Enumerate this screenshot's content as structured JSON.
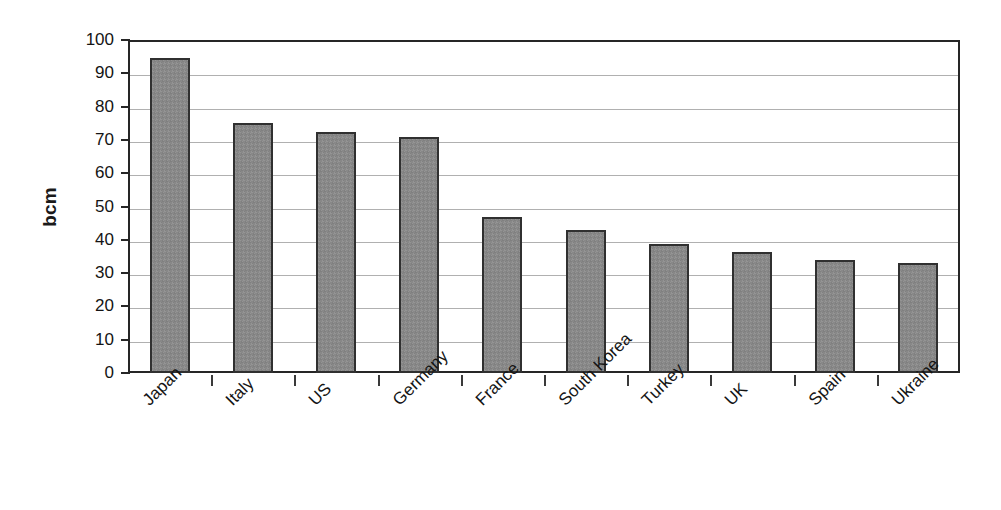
{
  "chart_data": {
    "type": "bar",
    "title": "",
    "xlabel": "",
    "ylabel": "bcm",
    "ylim": [
      0,
      100
    ],
    "ytick_step": 10,
    "yticks": [
      100,
      90,
      80,
      70,
      60,
      50,
      40,
      30,
      20,
      10,
      0
    ],
    "grid": true,
    "legend": false,
    "bar_color": "#888888",
    "bar_border_color": "#303030",
    "gridline_color": "#b0b0b0",
    "axis_color": "#262626",
    "categories": [
      "Japan",
      "Italy",
      "US",
      "Germany",
      "France",
      "South Korea",
      "Turkey",
      "UK",
      "Spain",
      "Ukraine"
    ],
    "values": [
      94.5,
      75,
      72.5,
      70.8,
      46.8,
      42.8,
      38.8,
      36.3,
      34,
      33
    ]
  }
}
